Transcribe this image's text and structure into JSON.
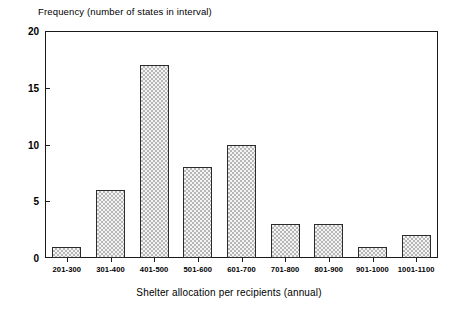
{
  "chart_data": {
    "type": "bar",
    "title": "",
    "ylabel": "Frequency (number of states in interval)",
    "xlabel": "Shelter allocation per recipients (annual)",
    "categories": [
      "201-300",
      "301-400",
      "401-500",
      "501-600",
      "601-700",
      "701-800",
      "801-900",
      "901-1000",
      "1001-1100"
    ],
    "values": [
      1,
      6,
      17,
      8,
      10,
      3,
      3,
      1,
      2
    ],
    "ylim": [
      0,
      20
    ],
    "yticks": [
      0,
      5,
      10,
      15,
      20
    ],
    "ytick_labels": [
      "0",
      "5",
      "10",
      "15",
      "20"
    ],
    "grid": false,
    "legend": null,
    "bar_fill": "#e9e9e9",
    "bar_edge": "#2b2b2b",
    "axis_color": "#1a1a1a",
    "background": "#ffffff"
  }
}
